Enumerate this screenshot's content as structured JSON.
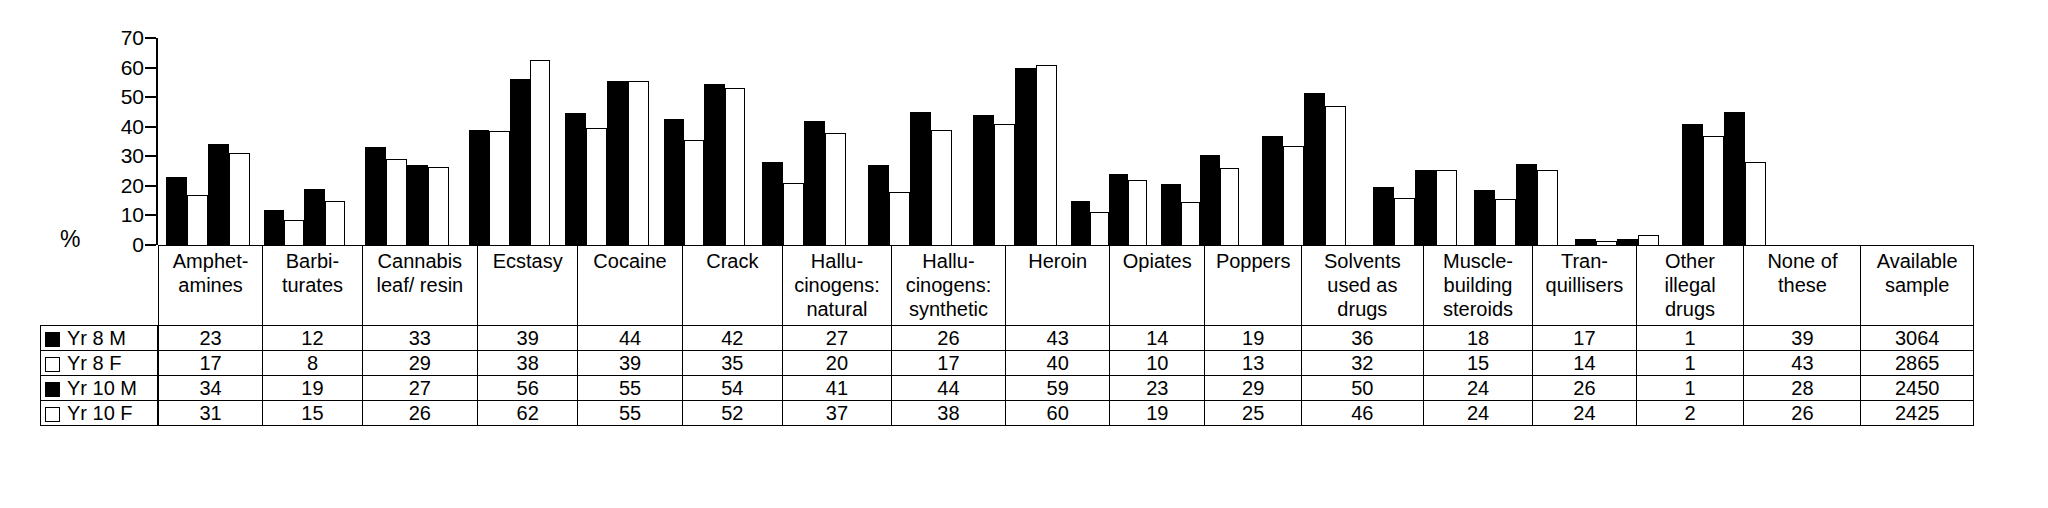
{
  "axis": {
    "ylabel": "%",
    "yticks": [
      0,
      10,
      20,
      30,
      40,
      50,
      60,
      70
    ],
    "ymin": 0,
    "ymax": 70
  },
  "legend": {
    "rows": [
      {
        "marker": "filled-square-icon",
        "label": "Yr 8 M"
      },
      {
        "marker": "open-square-icon",
        "label": "Yr 8 F"
      },
      {
        "marker": "filled-square-icon",
        "label": "Yr 10 M"
      },
      {
        "marker": "open-square-icon",
        "label": "Yr 10 F"
      }
    ]
  },
  "columns": [
    {
      "header": [
        "Amphet-",
        "amines"
      ]
    },
    {
      "header": [
        "Barbi-",
        "turates"
      ]
    },
    {
      "header": [
        "Cannabis",
        "leaf/ resin"
      ]
    },
    {
      "header": [
        "Ecstasy"
      ]
    },
    {
      "header": [
        "Cocaine"
      ]
    },
    {
      "header": [
        "Crack"
      ]
    },
    {
      "header": [
        "Hallu-",
        "cinogens:",
        "natural"
      ]
    },
    {
      "header": [
        "Hallu-",
        "cinogens:",
        "synthetic"
      ]
    },
    {
      "header": [
        "Heroin"
      ]
    },
    {
      "header": [
        "Opiates"
      ]
    },
    {
      "header": [
        "Poppers"
      ]
    },
    {
      "header": [
        "Solvents",
        "used as drugs"
      ]
    },
    {
      "header": [
        "Muscle-",
        "building",
        "steroids"
      ]
    },
    {
      "header": [
        "Tran-",
        "quillisers"
      ]
    },
    {
      "header": [
        "Other",
        "illegal drugs"
      ]
    },
    {
      "header": [
        "None of these"
      ]
    },
    {
      "header": [
        "Available",
        "sample"
      ]
    }
  ],
  "table_rows": [
    {
      "label": "Yr 8 M",
      "values": [
        23,
        12,
        33,
        39,
        44,
        42,
        27,
        26,
        43,
        14,
        19,
        36,
        18,
        17,
        1,
        39,
        3064
      ]
    },
    {
      "label": "Yr 8 F",
      "values": [
        17,
        8,
        29,
        38,
        39,
        35,
        20,
        17,
        40,
        10,
        13,
        32,
        15,
        14,
        1,
        43,
        2865
      ]
    },
    {
      "label": "Yr 10 M",
      "values": [
        34,
        19,
        27,
        56,
        55,
        54,
        41,
        44,
        59,
        23,
        29,
        50,
        24,
        26,
        1,
        28,
        2450
      ]
    },
    {
      "label": "Yr 10 F",
      "values": [
        31,
        15,
        26,
        62,
        55,
        52,
        37,
        38,
        60,
        19,
        25,
        46,
        24,
        24,
        2,
        26,
        2425
      ]
    }
  ],
  "chart_data": {
    "type": "bar",
    "title": "",
    "xlabel": "",
    "ylabel": "%",
    "ylim": [
      0,
      70
    ],
    "yticks": [
      0,
      10,
      20,
      30,
      40,
      50,
      60,
      70
    ],
    "grid": false,
    "legend_position": "left-table",
    "categories": [
      "Amphetamines",
      "Barbiturates",
      "Cannabis leaf/ resin",
      "Ecstasy",
      "Cocaine",
      "Crack",
      "Hallucinogens: natural",
      "Hallucinogens: synthetic",
      "Heroin",
      "Opiates",
      "Poppers",
      "Solvents used as drugs",
      "Muscle-building steroids",
      "Tranquillisers",
      "Other illegal drugs",
      "None of these"
    ],
    "series": [
      {
        "name": "Yr 8 M",
        "fill": "#000000",
        "values": [
          23,
          12,
          33,
          39,
          44.5,
          42.5,
          28,
          27,
          44,
          15,
          20.5,
          37,
          19.5,
          18.5,
          2,
          41
        ]
      },
      {
        "name": "Yr 8 F",
        "fill": "#ffffff",
        "values": [
          17,
          8.5,
          29,
          38.5,
          39.5,
          35.5,
          21,
          18,
          41,
          11,
          14.5,
          33.5,
          16,
          15.5,
          1.5,
          37
        ]
      },
      {
        "name": "Yr 10 M",
        "fill": "#000000",
        "values": [
          34,
          19,
          27,
          56,
          55.5,
          54.5,
          42,
          45,
          60,
          24,
          30.5,
          51.5,
          25.5,
          27.5,
          2,
          45
        ]
      },
      {
        "name": "Yr 10 F",
        "fill": "#ffffff",
        "values": [
          31,
          15,
          26.5,
          62.5,
          55.5,
          53,
          38,
          39,
          61,
          22,
          26,
          47,
          25.5,
          25.5,
          3.5,
          28
        ]
      }
    ],
    "table": {
      "row_labels": [
        "Yr 8 M",
        "Yr 8 F",
        "Yr 10 M",
        "Yr 10 F"
      ],
      "extra_column": {
        "header": "Available sample",
        "values": [
          3064,
          2865,
          2450,
          2425
        ]
      }
    }
  }
}
